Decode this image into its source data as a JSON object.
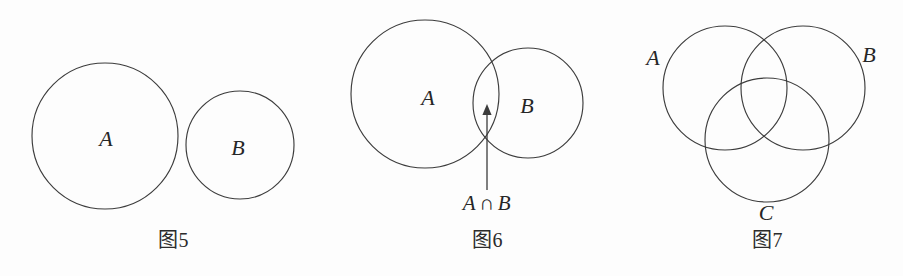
{
  "sheet": {
    "background_color": "#fdfdfd",
    "stroke_color": "#3c3c3c",
    "text_color": "#262626",
    "width": 903,
    "height": 276
  },
  "figures": [
    {
      "id": "fig5",
      "caption_prefix": "图",
      "caption_number": "5",
      "caption_full": "图5",
      "relation": "disjoint",
      "caption_x": 173,
      "caption_y": 240,
      "circles": [
        {
          "name": "A",
          "cx": 105,
          "cy": 136,
          "r": 73
        },
        {
          "name": "B",
          "cx": 240,
          "cy": 145,
          "r": 54
        }
      ],
      "labels": [
        {
          "text": "A",
          "x": 106,
          "y": 139
        },
        {
          "text": "B",
          "x": 238,
          "y": 148
        }
      ],
      "annotation": null
    },
    {
      "id": "fig6",
      "caption_prefix": "图",
      "caption_number": "6",
      "caption_full": "图6",
      "relation": "intersecting",
      "caption_x": 487,
      "caption_y": 240,
      "circles": [
        {
          "name": "A",
          "cx": 425,
          "cy": 94,
          "r": 74
        },
        {
          "name": "B",
          "cx": 528,
          "cy": 103,
          "r": 55
        }
      ],
      "labels": [
        {
          "text": "A",
          "x": 428,
          "y": 98
        },
        {
          "text": "B",
          "x": 527,
          "y": 106
        }
      ],
      "annotation": {
        "left_operand": "A",
        "operator": "∩",
        "right_operand": "B",
        "text": "A ∩ B",
        "x": 487,
        "y": 203,
        "arrow": {
          "x": 487,
          "tip_y": 104,
          "base_y": 190
        }
      }
    },
    {
      "id": "fig7",
      "caption_prefix": "图",
      "caption_number": "7",
      "caption_full": "图7",
      "relation": "triple-venn",
      "caption_x": 767,
      "caption_y": 240,
      "circles": [
        {
          "name": "A",
          "cx": 725,
          "cy": 88,
          "r": 62
        },
        {
          "name": "B",
          "cx": 803,
          "cy": 88,
          "r": 62
        },
        {
          "name": "C",
          "cx": 767,
          "cy": 140,
          "r": 62
        }
      ],
      "labels": [
        {
          "text": "A",
          "x": 653,
          "y": 58
        },
        {
          "text": "B",
          "x": 869,
          "y": 55
        },
        {
          "text": "C",
          "x": 766,
          "y": 213
        }
      ],
      "annotation": null
    }
  ]
}
